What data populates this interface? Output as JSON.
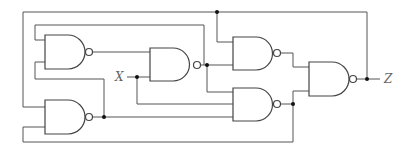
{
  "diagram": {
    "type": "logic circuit",
    "gate_type": "NAND",
    "gate_count": 5,
    "colors": {
      "line": "#555555",
      "junction": "#111111",
      "label": "#666666",
      "background": "#ffffff"
    },
    "labels": {
      "input": "X",
      "output": "Z"
    },
    "gates": [
      {
        "id": "G1",
        "label": "NAND gate 1 (top-left)"
      },
      {
        "id": "G2",
        "label": "NAND gate 2 (center)"
      },
      {
        "id": "G3",
        "label": "NAND gate 3 (top-right)"
      },
      {
        "id": "G4",
        "label": "NAND gate 4 (lower-right)"
      },
      {
        "id": "G5",
        "label": "NAND gate 5 (output)"
      },
      {
        "id": "G6",
        "label": "NAND gate 6 (bottom-left)"
      }
    ]
  }
}
